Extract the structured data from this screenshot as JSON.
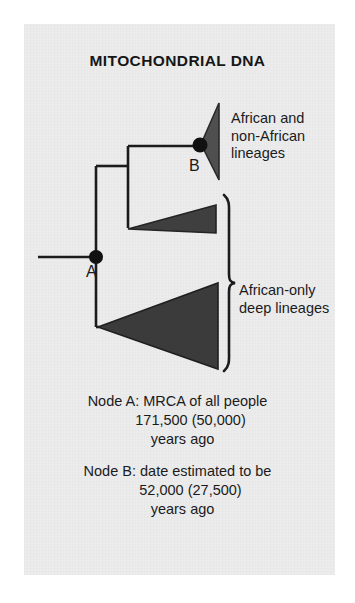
{
  "figure": {
    "title": "MITOCHONDRIAL DNA",
    "background_color": "#ececed",
    "page_color": "#ffffff",
    "ink_color": "#1b1b1b"
  },
  "diagram": {
    "type": "phylogenetic-tree",
    "nodes": [
      {
        "id": "A",
        "label": "A",
        "x": 96,
        "y": 257,
        "marker": "filled-circle"
      },
      {
        "id": "B",
        "label": "B",
        "x": 200,
        "y": 140,
        "marker": "filled-circle"
      }
    ],
    "clades": [
      {
        "name": "african-and-non-african",
        "label": "African and\nnon-African\nlineages",
        "fill": "#4f4f4f",
        "apex_x": 200,
        "apex_y": 140,
        "base_x": 219,
        "base_top_y": 103,
        "base_bottom_y": 178
      },
      {
        "name": "african-only-upper",
        "label": "",
        "fill": "#3f3f3f",
        "apex_x": 129,
        "apex_y": 228,
        "base_x": 216,
        "base_top_y": 205,
        "base_bottom_y": 232
      },
      {
        "name": "african-only-lower",
        "label": "",
        "fill": "#3b3b3b",
        "apex_x": 97,
        "apex_y": 327,
        "base_x": 218,
        "base_top_y": 283,
        "base_bottom_y": 368
      }
    ],
    "bracket": {
      "name": "african-only-bracket",
      "label": "African-only\ndeep lineages",
      "x": 225,
      "top_y": 194,
      "bottom_y": 372
    }
  },
  "labels": {
    "top_clade": "African and\nnon-African\nlineages",
    "bottom_clade": "African-only\ndeep lineages"
  },
  "captions": {
    "node_a": {
      "line1": "Node A: MRCA of all people",
      "line2": "171,500 (50,000)",
      "line3": "years ago"
    },
    "node_b": {
      "line1": "Node B: date estimated to be",
      "line2": "52,000 (27,500)",
      "line3": "years ago"
    }
  }
}
